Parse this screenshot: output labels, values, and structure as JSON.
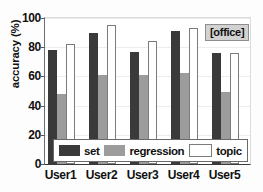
{
  "chart_data": {
    "type": "bar",
    "title": "",
    "xlabel": "",
    "ylabel": "accuracy (%)",
    "categories": [
      "User1",
      "User2",
      "User3",
      "User4",
      "User5"
    ],
    "series": [
      {
        "name": "set",
        "values": [
          78,
          90,
          77,
          91,
          76
        ],
        "color": "#3a3a3a"
      },
      {
        "name": "regression",
        "values": [
          48,
          61,
          61,
          62,
          49
        ],
        "color": "#9c9c9c"
      },
      {
        "name": "topic",
        "values": [
          82,
          95,
          84,
          93,
          76
        ],
        "color": "#ffffff"
      }
    ],
    "ylim": [
      0,
      100
    ],
    "yticks": [
      0,
      20,
      40,
      60,
      80,
      100
    ],
    "grid": true,
    "legend_position": "bottom-center",
    "annotations": [
      {
        "text": "[office]",
        "position": "top-right"
      }
    ]
  },
  "legend": {
    "entries": [
      {
        "label": "set"
      },
      {
        "label": "regression"
      },
      {
        "label": "topic"
      }
    ]
  },
  "annotation": {
    "text": "[office]"
  }
}
